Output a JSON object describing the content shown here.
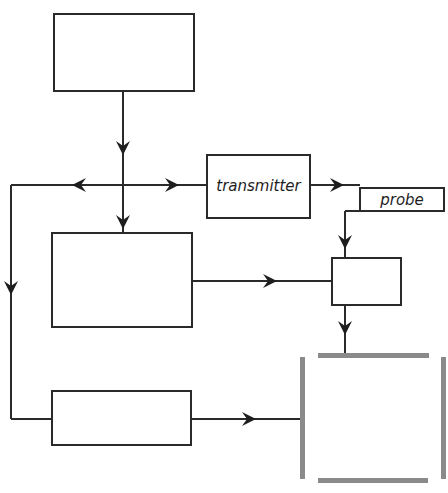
{
  "diagram": {
    "type": "block-diagram",
    "colors": {
      "line": "#2a2a2a",
      "bracket": "#8a8a8a",
      "background": "#ffffff"
    },
    "blocks": [
      {
        "id": "top-block",
        "label": ""
      },
      {
        "id": "transmitter-block",
        "label": "transmitter"
      },
      {
        "id": "probe-block",
        "label": "probe"
      },
      {
        "id": "middle-block",
        "label": ""
      },
      {
        "id": "small-block",
        "label": ""
      },
      {
        "id": "bottom-block",
        "label": ""
      },
      {
        "id": "target-chamber",
        "label": ""
      }
    ],
    "connections": [
      {
        "from": "top-block",
        "to": "junction"
      },
      {
        "from": "junction",
        "to": "transmitter-block"
      },
      {
        "from": "junction",
        "to": "middle-block"
      },
      {
        "from": "junction",
        "to": "left-feedback-line"
      },
      {
        "from": "left-feedback-line",
        "to": "bottom-block"
      },
      {
        "from": "transmitter-block",
        "to": "probe-block"
      },
      {
        "from": "probe-block",
        "to": "small-block"
      },
      {
        "from": "middle-block",
        "to": "small-block"
      },
      {
        "from": "small-block",
        "to": "target-chamber"
      },
      {
        "from": "bottom-block",
        "to": "target-chamber"
      }
    ]
  }
}
